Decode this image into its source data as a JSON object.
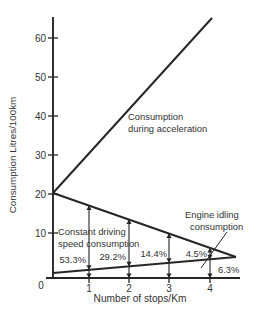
{
  "figure": {
    "background": "#ffffff",
    "ink": "#262626",
    "text_color": "#333333"
  },
  "labels": {
    "ylabel": "Consumption Litres/100km",
    "xlabel": "Number of stops/Km",
    "origin": "0",
    "acceleration_annotation": [
      "Consumption",
      "during acceleration"
    ],
    "constant_annotation": [
      "Constant driving",
      "speed consumption"
    ],
    "idle_annotation": [
      "Engine idling",
      "consumption"
    ]
  },
  "chart_data": {
    "type": "line",
    "title": "",
    "xlabel": "Number of stops/Km",
    "ylabel": "Consumption Litres/100km",
    "xlim": [
      0,
      4.8
    ],
    "ylim": [
      0,
      65
    ],
    "x_ticks": [
      0,
      1,
      2,
      3,
      4
    ],
    "y_ticks": [
      10,
      20,
      30,
      40,
      50,
      60
    ],
    "grid": false,
    "legend": "inline-annotations",
    "series": [
      {
        "name": "Consumption during acceleration",
        "points": [
          [
            0,
            21
          ],
          [
            4.1,
            65
          ]
        ]
      },
      {
        "name": "Constant driving speed consumption",
        "points": [
          [
            0,
            21
          ],
          [
            4.65,
            5
          ]
        ]
      },
      {
        "name": "Engine idling consumption",
        "points": [
          [
            0,
            1.5
          ],
          [
            4.65,
            5
          ]
        ]
      }
    ],
    "percent_labels": [
      {
        "stops": 1,
        "text": "53.3%"
      },
      {
        "stops": 2,
        "text": "29.2%"
      },
      {
        "stops": 3,
        "text": "14.4%"
      },
      {
        "stops": 4,
        "text": "4.5%"
      },
      {
        "stops": 4,
        "text": "6.3%",
        "series": "Engine idling consumption"
      }
    ]
  },
  "geometry": {
    "width": 263,
    "height": 322,
    "y_axis": {
      "x": 53,
      "y_top": 17,
      "y_bottom": 279
    },
    "x_axis": {
      "y": 278,
      "x_left": 46,
      "x_right": 240
    },
    "y_ticks": [
      {
        "v": "10",
        "y": 233
      },
      {
        "v": "20",
        "y": 194
      },
      {
        "v": "30",
        "y": 155
      },
      {
        "v": "40",
        "y": 116
      },
      {
        "v": "50",
        "y": 77
      },
      {
        "v": "60",
        "y": 38
      }
    ],
    "x_ticks": [
      {
        "v": "1",
        "x": 89
      },
      {
        "v": "2",
        "x": 129
      },
      {
        "v": "3",
        "x": 169
      },
      {
        "v": "4",
        "x": 210
      }
    ],
    "origin_label": {
      "x": 41,
      "y": 289
    },
    "lines": {
      "acceleration": [
        [
          53,
          193
        ],
        [
          212,
          18
        ]
      ],
      "constant": [
        [
          53,
          193
        ],
        [
          236,
          257
        ]
      ],
      "idle": [
        [
          53,
          273
        ],
        [
          236,
          257
        ]
      ]
    },
    "dimension_lines_x": [
      89,
      129,
      169,
      210
    ],
    "pointer": {
      "x1": 227,
      "y1": 232,
      "x2": 201,
      "y2": 268
    }
  }
}
